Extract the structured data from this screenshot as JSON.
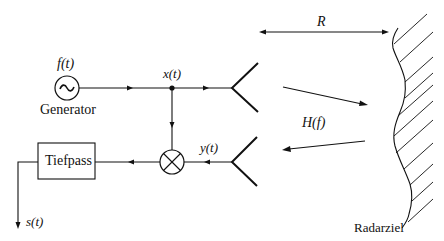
{
  "diagram": {
    "type": "block-diagram",
    "labels": {
      "generator_signal": "f(t)",
      "generator": "Generator",
      "transmit_signal": "x(t)",
      "receive_signal": "y(t)",
      "lowpass": "Tiefpass",
      "output_signal": "s(t)",
      "range": "R",
      "channel": "H(f)",
      "target": "Radarziel"
    },
    "symbols": {
      "generator_symbol": "~"
    },
    "colors": {
      "stroke": "#111111",
      "background": "#ffffff"
    }
  }
}
